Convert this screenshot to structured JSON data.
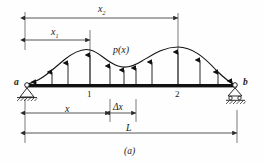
{
  "figure": {
    "caption": "(a)"
  },
  "labels": {
    "support_left": "a",
    "support_right": "b",
    "load_function": "p(x)",
    "station_1": "1",
    "station_2": "2",
    "dim_x1_main": "x",
    "dim_x1_sub": "1",
    "dim_x2_main": "x",
    "dim_x2_sub": "2",
    "dim_x": "x",
    "dim_delta_x": "Δx",
    "dim_L": "L"
  },
  "geometry": {
    "beam_left_x": 25,
    "beam_right_x": 237,
    "beam_y": 85,
    "beam_thickness": 3,
    "station_1_x": 90,
    "station_2_x": 178,
    "delta_left_x": 110,
    "delta_right_x": 136,
    "dim_x2_y": 18,
    "dim_x1_y": 40,
    "dim_x_y": 113,
    "dim_L_y": 133
  },
  "load_curve": {
    "type": "distributed-load",
    "arrow_x_positions": [
      36,
      52,
      68,
      90,
      110,
      124,
      136,
      152,
      178,
      200,
      218,
      232
    ],
    "arrow_top_y": [
      81,
      68,
      60,
      52,
      63,
      66,
      64,
      60,
      49,
      57,
      68,
      80
    ],
    "peak_1_x": 90,
    "peak_1_y": 51,
    "valley_x": 126,
    "valley_y": 66,
    "peak_2_x": 178,
    "peak_2_y": 48
  },
  "colors": {
    "ink": "#1a1a1a",
    "line": "#2b2b2b",
    "beam": "#111111",
    "background": "#fefefe"
  }
}
